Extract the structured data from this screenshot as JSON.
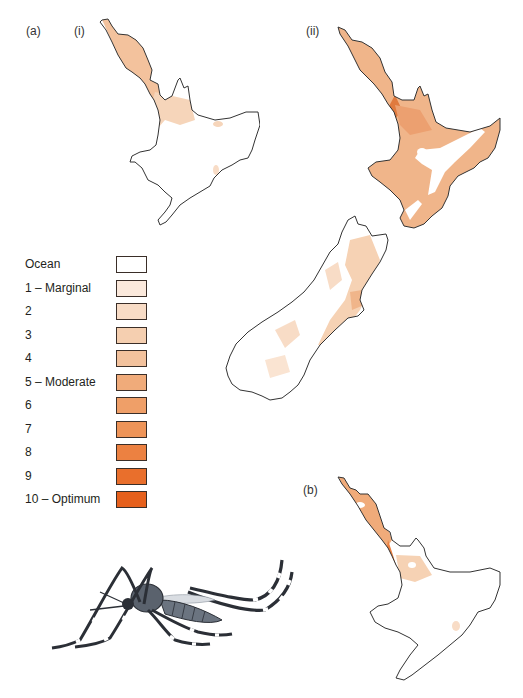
{
  "figure": {
    "panel_a_label": "(a)",
    "panel_i_label": "(i)",
    "panel_ii_label": "(ii)",
    "panel_b_label": "(b)"
  },
  "legend": {
    "items": [
      {
        "label": "Ocean",
        "color": "#ffffff"
      },
      {
        "label": "1 – Marginal",
        "color": "#fbe9dc"
      },
      {
        "label": "2",
        "color": "#f8dcc6"
      },
      {
        "label": "3",
        "color": "#f5cfb0"
      },
      {
        "label": "4",
        "color": "#f3c29d"
      },
      {
        "label": "5 – Moderate",
        "color": "#f0ab7a"
      },
      {
        "label": "6",
        "color": "#ef9f68"
      },
      {
        "label": "7",
        "color": "#ee9458"
      },
      {
        "label": "8",
        "color": "#ec8141"
      },
      {
        "label": "9",
        "color": "#e96f2c"
      },
      {
        "label": "10 – Optimum",
        "color": "#e6601c"
      }
    ]
  },
  "maps": {
    "outline_color": "#333333",
    "panel_i_fill": "#f3c29d",
    "panel_ii_fill": "#f0b58a",
    "panel_ii_hotspot": "#e07a3e",
    "south_island_fill": "#f6d2b4",
    "panel_b_fill": "#f0ab7a"
  },
  "illustration": {
    "subject": "mosquito",
    "body_color": "#2b2f36",
    "stripe_color": "#ffffff",
    "abdomen_color": "#6b7480"
  }
}
